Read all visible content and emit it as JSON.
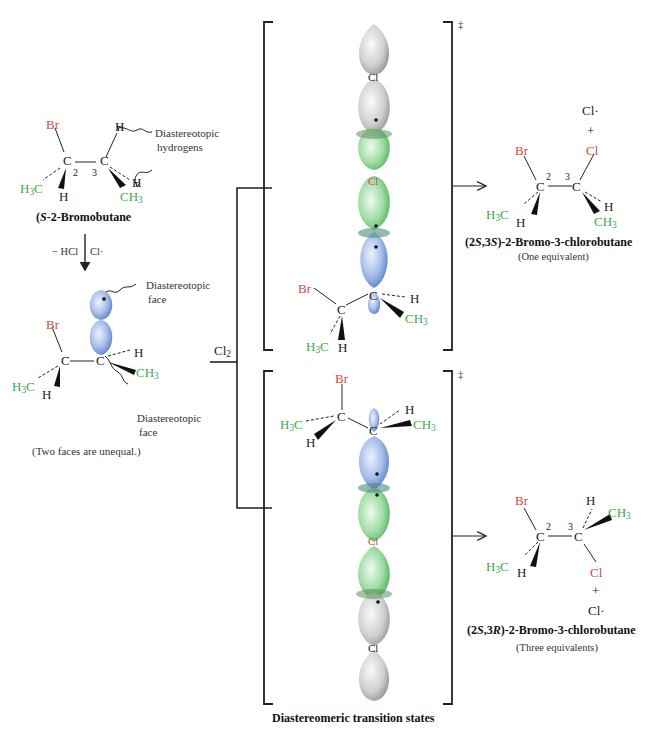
{
  "colors": {
    "bromine": "#d24a3a",
    "methyl": "#3ea84a",
    "orbital_blue": "#7f9fdc",
    "orbital_green": "#7fd08a",
    "orbital_gray": "#c8c8c8",
    "line": "#222222"
  },
  "starting_material": {
    "name": "(S)-2-Bromobutane",
    "name_italic": "S",
    "name_rest": "-2-Bromobutane",
    "atoms": {
      "br": "Br",
      "c2": "C",
      "c3": "C",
      "h_top": "H",
      "h_right": "H",
      "h_left": "H",
      "h3c": "H3C",
      "ch3": "CH3"
    },
    "locants": {
      "c2": "2",
      "c3": "3"
    },
    "annotation": "Diastereotopic hydrogens",
    "annotation_line1": "Diastereotopic",
    "annotation_line2": "hydrogens"
  },
  "step1": {
    "left_label": "− HCl",
    "right_label": "Cl·"
  },
  "radical": {
    "atoms": {
      "br": "Br",
      "c": "C",
      "c_rad": "C",
      "h_right": "H",
      "h_left": "H",
      "h3c": "H3C",
      "ch3": "CH3"
    },
    "top_annotation_line1": "Diastereotopic",
    "top_annotation_line2": "face",
    "bottom_annotation_line1": "Diastereotopic",
    "bottom_annotation_line2": "face",
    "caption": "(Two faces are unequal.)"
  },
  "reagent": {
    "label": "Cl2",
    "label_main": "Cl",
    "label_sub": "2"
  },
  "transition_states": {
    "caption": "Diastereomeric transition states",
    "double_dagger": "‡",
    "top": {
      "cl_labels": [
        "Cl",
        "Cl"
      ],
      "atoms": {
        "br": "Br",
        "c": "C",
        "c_rad": "C",
        "h_right": "H",
        "h_left": "H",
        "h3c": "H3C",
        "ch3": "CH3"
      }
    },
    "bottom": {
      "cl_labels": [
        "Cl",
        "Cl"
      ],
      "atoms": {
        "br": "Br",
        "c": "C",
        "c_rad": "C",
        "h_right": "H",
        "h_left": "H",
        "h3c": "H3C",
        "ch3": "CH3"
      }
    }
  },
  "product_top": {
    "byproduct": "Cl·",
    "plus": "+",
    "name_prefix": "(2",
    "name_s1": "S",
    "name_mid": ",3",
    "name_s2": "S",
    "name_rest": ")-2-Bromo-3-chlorobutane",
    "full_name": "(2S,3S)-2-Bromo-3-chlorobutane",
    "equivalents": "(One equivalent)",
    "atoms": {
      "br": "Br",
      "cl": "Cl",
      "c2": "C",
      "c3": "C",
      "h_left": "H",
      "h_right": "H",
      "h3c": "H3C",
      "ch3": "CH3"
    },
    "locants": {
      "c2": "2",
      "c3": "3"
    }
  },
  "product_bottom": {
    "byproduct": "Cl·",
    "plus": "+",
    "name_prefix": "(2",
    "name_s1": "S",
    "name_mid": ",3",
    "name_s2": "R",
    "name_rest": ")-2-Bromo-3-chlorobutane",
    "full_name": "(2S,3R)-2-Bromo-3-chlorobutane",
    "equivalents": "(Three equivalents)",
    "atoms": {
      "br": "Br",
      "cl": "Cl",
      "c2": "C",
      "c3": "C",
      "h_left": "H",
      "h_top": "H",
      "h3c": "H3C",
      "ch3": "CH3"
    },
    "locants": {
      "c2": "2",
      "c3": "3"
    }
  }
}
